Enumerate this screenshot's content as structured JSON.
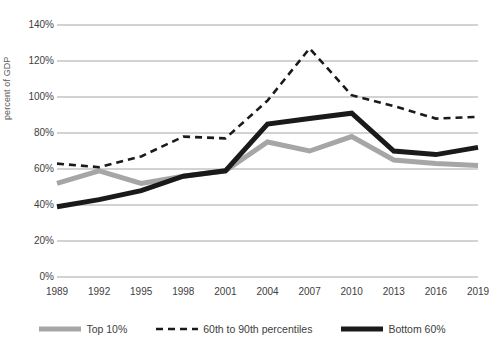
{
  "chart_data": {
    "type": "line",
    "title": "",
    "xlabel": "",
    "ylabel": "percent of GDP",
    "categories": [
      "1989",
      "1992",
      "1995",
      "1998",
      "2001",
      "2004",
      "2007",
      "2010",
      "2013",
      "2016",
      "2019"
    ],
    "x": [
      1989,
      1992,
      1995,
      1998,
      2001,
      2004,
      2007,
      2010,
      2013,
      2016,
      2019
    ],
    "ylim": [
      0,
      140
    ],
    "ytick_labels": [
      "0%",
      "20%",
      "40%",
      "60%",
      "80%",
      "100%",
      "120%",
      "140%"
    ],
    "ytick_values": [
      0,
      20,
      40,
      60,
      80,
      100,
      120,
      140
    ],
    "grid": "horizontal",
    "legend_position": "bottom",
    "units": "percent of GDP",
    "series": [
      {
        "name": "Top 10%",
        "style": "solid",
        "color": "#a6a6a6",
        "width": 5,
        "values": [
          52,
          59,
          52,
          56,
          59,
          75,
          70,
          78,
          65,
          63,
          62
        ]
      },
      {
        "name": "60th to 90th percentiles",
        "style": "dashed",
        "color": "#1a1a1a",
        "width": 2.6,
        "values": [
          63,
          61,
          67,
          78,
          77,
          98,
          127,
          101,
          95,
          88,
          89
        ]
      },
      {
        "name": "Bottom 60%",
        "style": "solid",
        "color": "#1a1a1a",
        "width": 5,
        "values": [
          39,
          43,
          48,
          56,
          59,
          85,
          88,
          91,
          70,
          68,
          72
        ]
      }
    ]
  },
  "legend": {
    "items": [
      {
        "label": "Top 10%"
      },
      {
        "label": "60th to 90th percentiles"
      },
      {
        "label": "Bottom 60%"
      }
    ]
  },
  "colors": {
    "gray_series": "#a6a6a6",
    "black_series": "#1a1a1a",
    "gridline": "#a6a6a6",
    "text": "#404040",
    "background": "#ffffff"
  }
}
